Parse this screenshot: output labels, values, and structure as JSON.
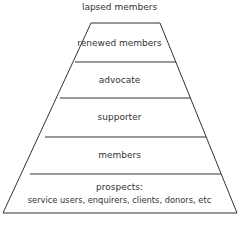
{
  "diagram": {
    "top_label": "lapsed members",
    "levels": [
      {
        "label": "renewed members"
      },
      {
        "label": "advocate"
      },
      {
        "label": "supporter"
      },
      {
        "label": "members"
      },
      {
        "label": "prospects:",
        "sublabel": "service users, enquirers, clients, donors, etc"
      }
    ],
    "line_color": "#333333"
  }
}
